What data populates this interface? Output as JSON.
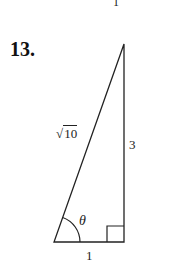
{
  "problem": {
    "number": "13.",
    "previous_fragment": "1"
  },
  "triangle": {
    "type": "right triangle",
    "hypotenuse_label": "10",
    "hypotenuse_prefix": "√",
    "opposite_label": "3",
    "adjacent_label": "1",
    "angle_label": "θ",
    "right_angle_marker": true,
    "stroke_color": "#222222"
  }
}
